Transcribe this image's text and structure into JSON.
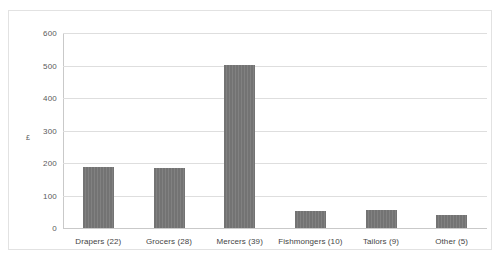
{
  "chart_data": {
    "type": "bar",
    "title": "",
    "subtitle": "",
    "xlabel": "",
    "ylabel": "£",
    "categories": [
      "Drapers (22)",
      "Grocers (28)",
      "Mercers (39)",
      "Fishmongers (10)",
      "Tailors (9)",
      "Other (5)"
    ],
    "values": [
      187,
      184,
      503,
      52,
      56,
      39
    ],
    "ylim": [
      0,
      600
    ],
    "ytick_labels": [
      "600",
      "500",
      "400",
      "300",
      "200",
      "100",
      "0"
    ],
    "ytick_values": [
      600,
      500,
      400,
      300,
      200,
      100,
      0
    ],
    "grid": true,
    "legend": false,
    "legend_position": "none",
    "colors": {
      "bar_fill": "#737373",
      "gridline": "#dedede",
      "axis_line": "#c9c9c9",
      "frame_border": "#e2e2e2",
      "tick_text": "#5a5a5a",
      "category_text": "#444444",
      "plot_background": "#ffffff"
    }
  }
}
